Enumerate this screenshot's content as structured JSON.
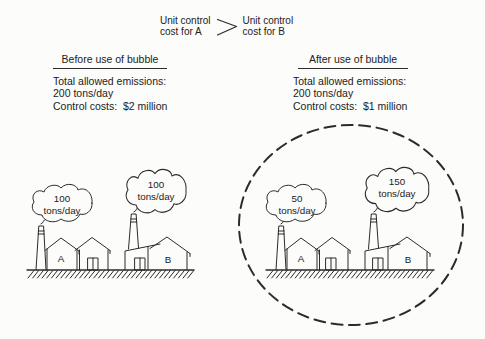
{
  "inequality": {
    "left": "Unit control\ncost for A",
    "symbol": ">",
    "right": "Unit control\ncost for B"
  },
  "before": {
    "title": "Before use of bubble",
    "lines": [
      "Total allowed emissions:",
      "200 tons/day",
      "Control costs:  $2 million"
    ]
  },
  "after": {
    "title": "After use of bubble",
    "lines": [
      "Total allowed emissions:",
      "200 tons/day",
      "Control costs:  $1 million"
    ]
  },
  "scenes": {
    "before": {
      "factory_a": {
        "label": "A",
        "value": "100",
        "unit": "tons/day"
      },
      "factory_b": {
        "label": "B",
        "value": "100",
        "unit": "tons/day"
      }
    },
    "after": {
      "factory_a": {
        "label": "A",
        "value": "50",
        "unit": "tons/day"
      },
      "factory_b": {
        "label": "B",
        "value": "150",
        "unit": "tons/day"
      }
    }
  },
  "colors": {
    "ink": "#2b2b2b",
    "paper": "#fcfcfa"
  }
}
